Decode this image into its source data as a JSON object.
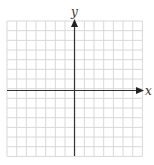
{
  "diagram": {
    "type": "coordinate-grid",
    "x_axis_label": "x",
    "y_axis_label": "y",
    "grid": {
      "columns": 14,
      "rows": 14,
      "cells_left_of_y_axis": 7,
      "cells_above_x_axis": 7
    },
    "colors": {
      "grid": "#d8d8d8",
      "axis": "#333333",
      "background": "#ffffff"
    }
  }
}
